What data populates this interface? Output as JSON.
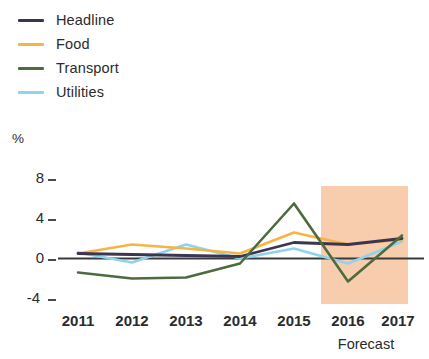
{
  "legend": {
    "items": [
      {
        "label": "Headline",
        "color": "#3c3550",
        "key": "headline"
      },
      {
        "label": "Food",
        "color": "#f5b544",
        "key": "food"
      },
      {
        "label": "Transport",
        "color": "#4d6b3c",
        "key": "transport"
      },
      {
        "label": "Utilities",
        "color": "#8fd3ee",
        "key": "utilities"
      }
    ]
  },
  "axes": {
    "y_unit_label": "%",
    "y_ticks": [
      "8",
      "4",
      "0",
      "-4"
    ],
    "x_ticks": [
      "2011",
      "2012",
      "2013",
      "2014",
      "2015",
      "2016",
      "2017"
    ]
  },
  "annotations": {
    "forecast_caption": "Forecast",
    "forecast_shade_color": "#f8cdae"
  },
  "chart_data": {
    "type": "line",
    "title": "",
    "subtitle": "",
    "xlabel": "",
    "ylabel": "%",
    "x": [
      2011,
      2012,
      2013,
      2014,
      2015,
      2016,
      2017
    ],
    "categories": [
      "2011",
      "2012",
      "2013",
      "2014",
      "2015",
      "2016",
      "2017"
    ],
    "ylim": [
      -4,
      8
    ],
    "xlim": [
      2011,
      2017
    ],
    "y_ticks": [
      -4,
      0,
      4,
      8
    ],
    "grid": false,
    "zero_line": true,
    "legend_position": "top-left",
    "series": [
      {
        "name": "Headline",
        "color": "#3c3550",
        "values": [
          0.5,
          0.4,
          0.3,
          0.2,
          1.6,
          1.4,
          2.0
        ]
      },
      {
        "name": "Food",
        "color": "#f5b544",
        "values": [
          0.5,
          1.4,
          1.0,
          0.5,
          2.6,
          1.4,
          1.9
        ]
      },
      {
        "name": "Transport",
        "color": "#4d6b3c",
        "values": [
          -1.4,
          -2.0,
          -1.9,
          -0.5,
          5.5,
          -2.3,
          2.3
        ]
      },
      {
        "name": "Utilities",
        "color": "#8fd3ee",
        "values": [
          0.6,
          -0.4,
          1.4,
          0.0,
          1.0,
          -0.5,
          1.7
        ]
      }
    ],
    "annotations": [
      {
        "type": "shaded_band",
        "label": "Forecast",
        "x_start": 2015.5,
        "x_end": 2017,
        "color": "#f8cdae"
      }
    ]
  }
}
